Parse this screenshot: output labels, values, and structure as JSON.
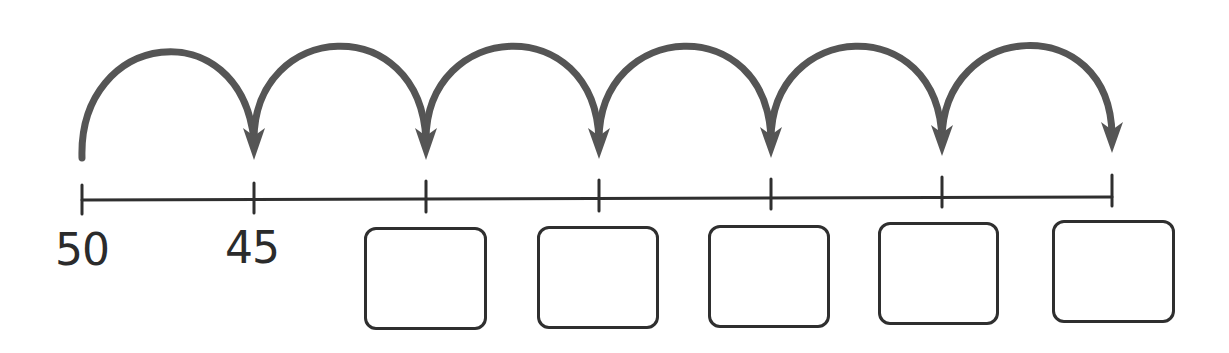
{
  "diagram": {
    "type": "number-line-jumps",
    "line": {
      "y": 199,
      "x_start": 82,
      "x_end": 1112,
      "color": "#2f2f2f"
    },
    "arrow_color": "#555555",
    "ticks": [
      {
        "x": 82,
        "label": "50"
      },
      {
        "x": 254,
        "label": "45"
      },
      {
        "x": 426,
        "label": ""
      },
      {
        "x": 599,
        "label": ""
      },
      {
        "x": 771,
        "label": ""
      },
      {
        "x": 942,
        "label": ""
      },
      {
        "x": 1112,
        "label": ""
      }
    ],
    "jumps": 6,
    "step": -5,
    "answer_boxes": [
      {
        "x": 364,
        "y": 227,
        "w": 123,
        "h": 103,
        "value": ""
      },
      {
        "x": 537,
        "y": 226,
        "w": 122,
        "h": 103,
        "value": ""
      },
      {
        "x": 708,
        "y": 225,
        "w": 122,
        "h": 103,
        "value": ""
      },
      {
        "x": 878,
        "y": 222,
        "w": 121,
        "h": 103,
        "value": ""
      },
      {
        "x": 1052,
        "y": 220,
        "w": 123,
        "h": 103,
        "value": ""
      }
    ]
  },
  "labels": {
    "start": "50",
    "second": "45"
  }
}
